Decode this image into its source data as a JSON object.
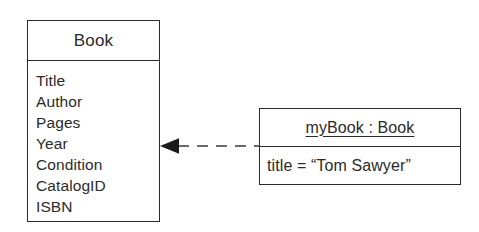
{
  "diagram": {
    "type": "uml-object-instantiation",
    "background_color": "#ffffff",
    "stroke_color": "#2b2b2b",
    "class_box": {
      "name": "Book",
      "attributes": [
        "Title",
        "Author",
        "Pages",
        "Year",
        "Condition",
        "CatalogID",
        "ISBN"
      ]
    },
    "object_box": {
      "name": "myBook : Book",
      "slots": [
        "title = “Tom Sawyer”"
      ]
    },
    "connector": {
      "kind": "dashed-arrow",
      "arrow_head": "solid-filled-triangle",
      "direction": "points-left-to-class",
      "label": ""
    }
  }
}
